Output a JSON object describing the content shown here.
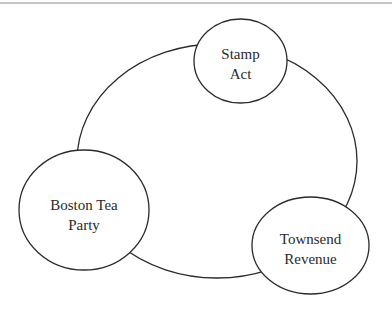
{
  "diagram": {
    "type": "cycle",
    "style": {
      "stroke": "#2b2b2b",
      "fill": "#ffffff",
      "text_color": "#2a2a2a",
      "top_rule_color": "#c4c4c4"
    },
    "nodes": [
      {
        "id": "stamp",
        "line1": "Stamp",
        "line2": "Act"
      },
      {
        "id": "townsend",
        "line1": "Townsend",
        "line2": "Revenue"
      },
      {
        "id": "boston",
        "line1": "Boston Tea",
        "line2": "Party"
      }
    ]
  }
}
